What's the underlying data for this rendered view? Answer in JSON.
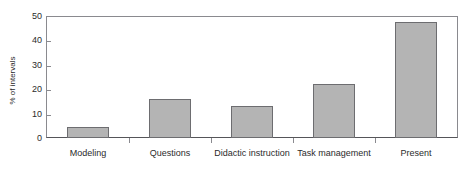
{
  "artifact": {
    "top_clipped_text": "",
    "note": ""
  },
  "chart_data": {
    "type": "bar",
    "title": "",
    "xlabel": "",
    "ylabel": "% of intervals",
    "categories": [
      "Modeling",
      "Questions",
      "Didactic instruction",
      "Task management",
      "Present"
    ],
    "values": [
      4.5,
      16,
      13,
      22,
      47.5
    ],
    "ylim": [
      0,
      50
    ],
    "yticks": [
      0,
      10,
      20,
      30,
      40,
      50
    ],
    "ytick_labels": [
      "0",
      "10",
      "20",
      "30",
      "40",
      "50"
    ],
    "grid": false,
    "legend": "none",
    "bar_color": "#b4b4b4",
    "bar_edge_color": "#6d6d70",
    "axis_color": "#8a8a8f",
    "text_color": "#2b2b2b"
  }
}
